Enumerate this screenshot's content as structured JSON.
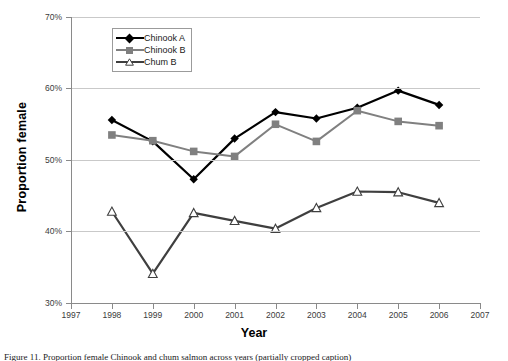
{
  "chart_data": {
    "type": "line",
    "title": "",
    "xlabel": "Year",
    "ylabel": "Proportion female",
    "xlim": [
      1997,
      2007
    ],
    "ylim": [
      30,
      70
    ],
    "x_ticks": [
      1997,
      1998,
      1999,
      2000,
      2001,
      2002,
      2003,
      2004,
      2005,
      2006,
      2007
    ],
    "y_ticks": [
      "30%",
      "40%",
      "50%",
      "60%",
      "70%"
    ],
    "y_tick_values": [
      30,
      40,
      50,
      60,
      70
    ],
    "grid": "horizontal",
    "legend_position": "top-center-inside",
    "x": [
      1998,
      1999,
      2000,
      2001,
      2002,
      2003,
      2004,
      2005,
      2006
    ],
    "series": [
      {
        "name": "Chinook A",
        "marker": "diamond",
        "color": "#000000",
        "values": [
          55.6,
          52.6,
          47.3,
          53.0,
          56.7,
          55.8,
          57.3,
          59.7,
          57.7
        ]
      },
      {
        "name": "Chinook B",
        "marker": "square",
        "color": "#808080",
        "values": [
          53.5,
          52.7,
          51.2,
          50.5,
          55.0,
          52.6,
          56.9,
          55.4,
          54.8
        ]
      },
      {
        "name": "Chum B",
        "marker": "triangle-open",
        "color": "#3f3f3f",
        "values": [
          42.8,
          34.1,
          42.6,
          41.5,
          40.4,
          43.3,
          45.6,
          45.5,
          44.0
        ]
      }
    ]
  },
  "axes": {
    "y_label": "Proportion female",
    "x_label": "Year"
  },
  "legend": {
    "items": [
      {
        "label": "Chinook A"
      },
      {
        "label": "Chinook B"
      },
      {
        "label": "Chum B"
      }
    ]
  },
  "caption": {
    "text": "Figure 11. Proportion female Chinook and chum salmon across years (partially cropped caption)"
  }
}
